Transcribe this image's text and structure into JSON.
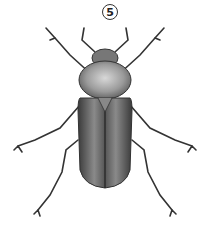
{
  "figure": {
    "label": "5",
    "colors": {
      "background": "#ffffff",
      "body_dark": "#3a3a3a",
      "body_mid": "#777777",
      "pronotum_light": "#bdbdbd"
    }
  }
}
